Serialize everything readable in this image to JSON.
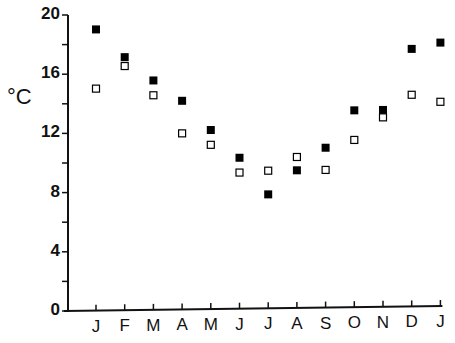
{
  "chart_data": {
    "type": "scatter",
    "title": "",
    "xlabel": "",
    "ylabel": "°C",
    "ylim": [
      0,
      20
    ],
    "yticks": [
      0,
      4,
      8,
      12,
      16,
      20
    ],
    "yticks_minor": [
      2,
      6,
      10,
      14,
      18
    ],
    "grid": false,
    "legend": null,
    "categories": [
      "J",
      "F",
      "M",
      "A",
      "M",
      "J",
      "J",
      "A",
      "S",
      "O",
      "N",
      "D",
      "J"
    ],
    "series": [
      {
        "name": "filled squares",
        "marker": "filled-square",
        "color": "#000000",
        "values": [
          19.0,
          17.1,
          15.5,
          14.1,
          12.1,
          10.2,
          7.7,
          9.3,
          10.8,
          13.3,
          13.3,
          17.4,
          17.8
        ]
      },
      {
        "name": "open squares",
        "marker": "open-square",
        "color": "#000000",
        "values": [
          15.0,
          16.5,
          14.5,
          11.9,
          11.1,
          9.2,
          9.3,
          10.2,
          9.3,
          11.3,
          12.8,
          14.3,
          13.8
        ]
      }
    ]
  }
}
